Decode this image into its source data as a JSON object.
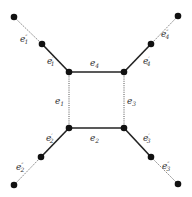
{
  "diagram": {
    "vertices": [
      {
        "id": "sq_tl",
        "x": 69,
        "y": 72
      },
      {
        "id": "sq_tr",
        "x": 124,
        "y": 72
      },
      {
        "id": "sq_bl",
        "x": 69,
        "y": 128
      },
      {
        "id": "sq_br",
        "x": 124,
        "y": 128
      },
      {
        "id": "mid_tl",
        "x": 42,
        "y": 44
      },
      {
        "id": "mid_tr",
        "x": 151,
        "y": 44
      },
      {
        "id": "mid_bl",
        "x": 41,
        "y": 157
      },
      {
        "id": "mid_br",
        "x": 151,
        "y": 157
      },
      {
        "id": "out_tl",
        "x": 14,
        "y": 17
      },
      {
        "id": "out_tr",
        "x": 178,
        "y": 16
      },
      {
        "id": "out_bl",
        "x": 14,
        "y": 185
      },
      {
        "id": "out_br",
        "x": 178,
        "y": 184
      }
    ],
    "edges": [
      {
        "id": "e4",
        "label": "e",
        "sub": "4",
        "prime": "",
        "style": "solid",
        "from": "sq_tl",
        "to": "sq_tr"
      },
      {
        "id": "e2",
        "label": "e",
        "sub": "2",
        "prime": "",
        "style": "solid",
        "from": "sq_bl",
        "to": "sq_br"
      },
      {
        "id": "e1",
        "label": "e",
        "sub": "1",
        "prime": "",
        "style": "dotted",
        "from": "sq_tl",
        "to": "sq_bl"
      },
      {
        "id": "e3",
        "label": "e",
        "sub": "3",
        "prime": "",
        "style": "dotted",
        "from": "sq_tr",
        "to": "sq_br"
      },
      {
        "id": "e1p",
        "label": "e",
        "sub": "1",
        "prime": "′",
        "style": "solid",
        "from": "mid_tl",
        "to": "sq_tl"
      },
      {
        "id": "e4p",
        "label": "e",
        "sub": "4",
        "prime": "′",
        "style": "solid",
        "from": "mid_tr",
        "to": "sq_tr"
      },
      {
        "id": "e2p",
        "label": "e",
        "sub": "2",
        "prime": "′",
        "style": "solid",
        "from": "mid_bl",
        "to": "sq_bl"
      },
      {
        "id": "e3p",
        "label": "e",
        "sub": "3",
        "prime": "′",
        "style": "solid",
        "from": "mid_br",
        "to": "sq_br"
      },
      {
        "id": "e1pp",
        "label": "e",
        "sub": "1",
        "prime": "″",
        "style": "thin",
        "from": "out_tl",
        "to": "mid_tl"
      },
      {
        "id": "e4pp",
        "label": "e",
        "sub": "4",
        "prime": "″",
        "style": "thin",
        "from": "out_tr",
        "to": "mid_tr"
      },
      {
        "id": "e2pp",
        "label": "e",
        "sub": "2",
        "prime": "″",
        "style": "thin",
        "from": "out_bl",
        "to": "mid_bl"
      },
      {
        "id": "e3pp",
        "label": "e",
        "sub": "3",
        "prime": "″",
        "style": "thin",
        "from": "out_br",
        "to": "mid_br"
      }
    ],
    "labels": {
      "e4": {
        "x": 90,
        "y": 66
      },
      "e2": {
        "x": 90,
        "y": 141
      },
      "e1": {
        "x": 55,
        "y": 104
      },
      "e3": {
        "x": 127,
        "y": 104
      },
      "e1p": {
        "x": 47,
        "y": 64
      },
      "e4p": {
        "x": 143,
        "y": 64
      },
      "e2p": {
        "x": 46,
        "y": 141
      },
      "e3p": {
        "x": 143,
        "y": 141
      },
      "e1pp": {
        "x": 20,
        "y": 42
      },
      "e4pp": {
        "x": 161,
        "y": 37
      },
      "e2pp": {
        "x": 16,
        "y": 170
      },
      "e3pp": {
        "x": 162,
        "y": 169
      }
    }
  }
}
